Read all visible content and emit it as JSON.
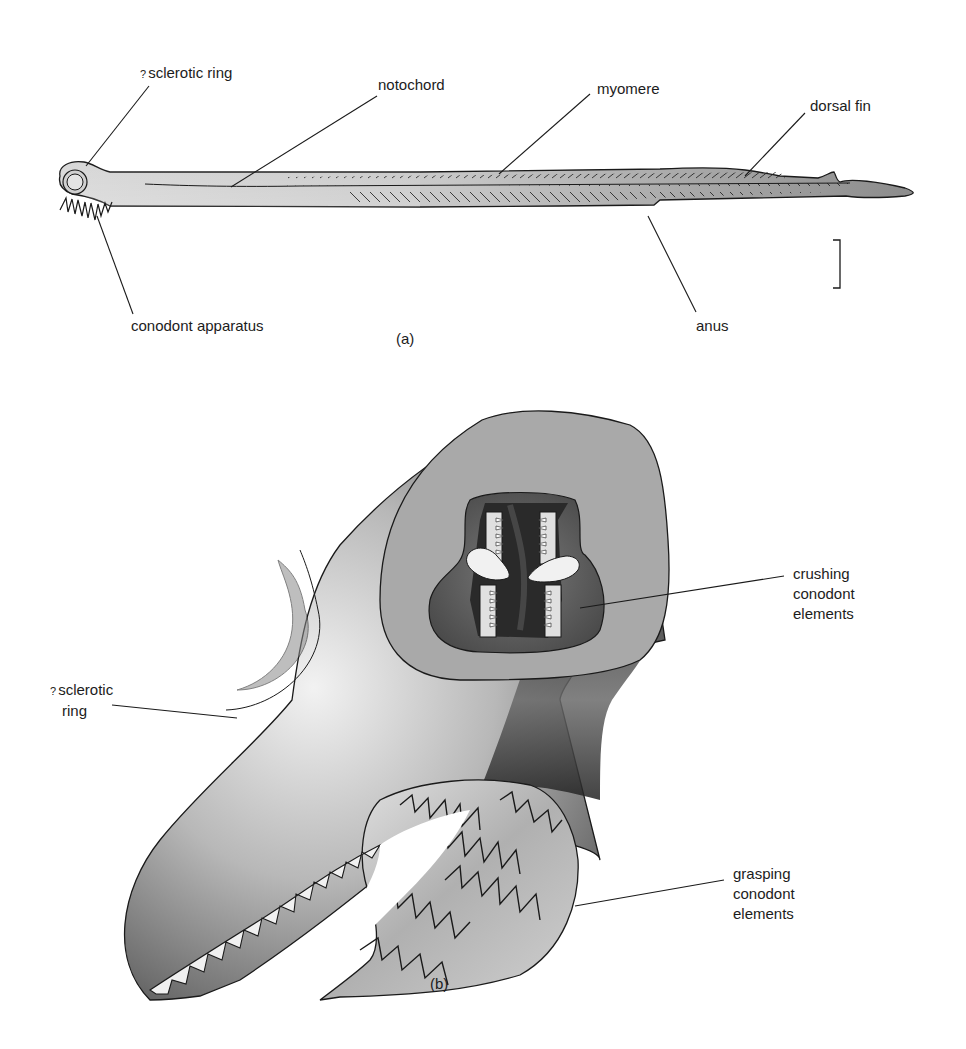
{
  "figure": {
    "panel_a": {
      "caption": "(a)",
      "labels": {
        "sclerotic_ring_prefix": "?",
        "sclerotic_ring": "sclerotic ring",
        "notochord": "notochord",
        "myomere": "myomere",
        "dorsal_fin": "dorsal fin",
        "conodont_apparatus": "conodont apparatus",
        "anus": "anus"
      },
      "scale_bar": "scale bar"
    },
    "panel_b": {
      "caption": "(b)",
      "labels": {
        "sclerotic_ring_prefix": "?",
        "sclerotic_ring_line1": "sclerotic",
        "sclerotic_ring_line2": "ring",
        "crushing_line1": "crushing",
        "crushing_line2": "conodont",
        "crushing_line3": "elements",
        "grasping_line1": "grasping",
        "grasping_line2": "conodont",
        "grasping_line3": "elements"
      }
    },
    "colors": {
      "background": "#ffffff",
      "outline": "#1a1a1a",
      "body_light": "#d9d9d9",
      "body_mid": "#9a9a9a",
      "body_dark": "#4a4a4a",
      "cut_face": "#a8a8a8",
      "mouth_dark": "#2a2a2a"
    }
  }
}
